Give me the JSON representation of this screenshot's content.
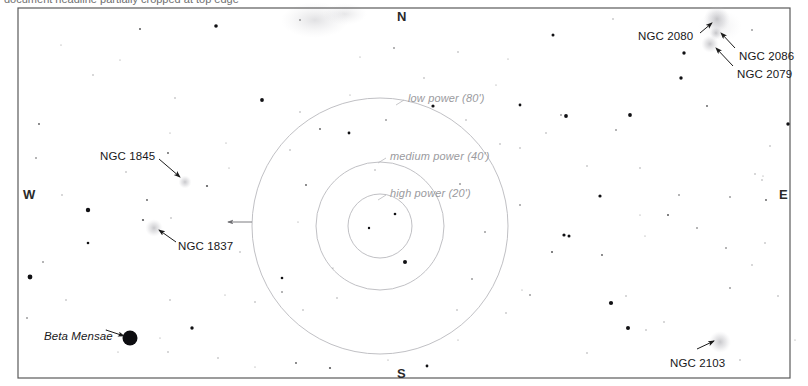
{
  "page": {
    "title_partial": "document headline partially cropped at top edge",
    "background": "#ffffff",
    "frame_color": "#5a5a5a",
    "width": 808,
    "height": 386
  },
  "frame": {
    "x": 18,
    "y": 8,
    "width": 772,
    "height": 370
  },
  "cardinals": [
    {
      "name": "north",
      "label": "N",
      "x": 397,
      "y": 9
    },
    {
      "name": "south",
      "label": "S",
      "x": 397,
      "y": 366
    },
    {
      "name": "east",
      "label": "E",
      "x": 779,
      "y": 187
    },
    {
      "name": "west",
      "label": "W",
      "x": 23,
      "y": 187
    }
  ],
  "eyepiece_circles": {
    "center_x": 380,
    "center_y": 226,
    "stroke": "#b9b9bd",
    "rings": [
      {
        "name": "low-power-ring",
        "label": "low power (80')",
        "radius": 128,
        "label_x": 408,
        "label_y": 92,
        "tick_x": 404,
        "tick_y": 100
      },
      {
        "name": "medium-power-ring",
        "label": "medium power (40')",
        "radius": 64,
        "label_x": 390,
        "label_y": 150,
        "tick_x": 386,
        "tick_y": 158
      },
      {
        "name": "high-power-ring",
        "label": "high power (20')",
        "radius": 32,
        "label_x": 390,
        "label_y": 187,
        "tick_x": 386,
        "tick_y": 195
      }
    ],
    "pointer_arrow": {
      "from_x": 252,
      "from_y": 222,
      "to_x": 228,
      "to_y": 222
    }
  },
  "deep_sky_objects": [
    {
      "name": "ngc-2080",
      "label": "NGC 2080",
      "label_x": 638,
      "label_y": 30,
      "glow_x": 717,
      "glow_y": 19,
      "glow_r": 6,
      "leader": {
        "x1": 700,
        "y1": 33,
        "x2": 712,
        "y2": 23
      }
    },
    {
      "name": "ngc-2086",
      "label": "NGC 2086",
      "label_x": 739,
      "label_y": 50,
      "glow_x": 716,
      "glow_y": 33,
      "glow_r": 3,
      "leader": {
        "x1": 735,
        "y1": 48,
        "x2": 721,
        "y2": 33
      }
    },
    {
      "name": "ngc-2079",
      "label": "NGC 2079",
      "label_x": 737,
      "label_y": 68,
      "glow_x": 710,
      "glow_y": 44,
      "glow_r": 4,
      "leader": {
        "x1": 733,
        "y1": 66,
        "x2": 716,
        "y2": 48
      }
    },
    {
      "name": "ngc-1845",
      "label": "NGC 1845",
      "label_x": 100,
      "label_y": 150,
      "glow_x": 185,
      "glow_y": 182,
      "glow_r": 3,
      "leader": {
        "x1": 159,
        "y1": 159,
        "x2": 180,
        "y2": 177
      }
    },
    {
      "name": "ngc-1837",
      "label": "NGC 1837",
      "label_x": 178,
      "label_y": 240,
      "glow_x": 154,
      "glow_y": 228,
      "glow_r": 4,
      "leader": {
        "x1": 176,
        "y1": 242,
        "x2": 159,
        "y2": 230
      }
    },
    {
      "name": "ngc-2103",
      "label": "NGC 2103",
      "label_x": 670,
      "label_y": 357,
      "glow_x": 720,
      "glow_y": 342,
      "glow_r": 5,
      "leader": {
        "x1": 697,
        "y1": 349,
        "x2": 714,
        "y2": 341
      }
    }
  ],
  "named_stars": [
    {
      "name": "beta-mensae",
      "label": "Beta Mensae",
      "label_x": 44,
      "label_y": 330,
      "star_x": 130,
      "star_y": 338,
      "star_r": 7.5,
      "leader": {
        "x1": 106,
        "y1": 330,
        "x2": 124,
        "y2": 336
      }
    }
  ],
  "nebulosity": [
    {
      "name": "lmc-haze-top",
      "cx": 315,
      "cy": 20,
      "rx": 34,
      "ry": 18,
      "opacity": 0.09
    },
    {
      "name": "lmc-haze-top-right",
      "cx": 345,
      "cy": 14,
      "rx": 22,
      "ry": 11,
      "opacity": 0.07
    },
    {
      "name": "lmc-haze-ne",
      "cx": 720,
      "cy": 26,
      "rx": 22,
      "ry": 16,
      "opacity": 0.05
    }
  ],
  "stars": [
    {
      "x": 140,
      "y": 29,
      "r": 1.0
    },
    {
      "x": 216,
      "y": 26,
      "r": 1.8
    },
    {
      "x": 300,
      "y": 20,
      "r": 0.8
    },
    {
      "x": 360,
      "y": 57,
      "r": 0.6
    },
    {
      "x": 394,
      "y": 48,
      "r": 0.8
    },
    {
      "x": 458,
      "y": 52,
      "r": 0.7
    },
    {
      "x": 508,
      "y": 59,
      "r": 0.6
    },
    {
      "x": 553,
      "y": 35,
      "r": 1.5
    },
    {
      "x": 613,
      "y": 19,
      "r": 0.7
    },
    {
      "x": 684,
      "y": 53,
      "r": 1.7
    },
    {
      "x": 752,
      "y": 30,
      "r": 0.8
    },
    {
      "x": 772,
      "y": 60,
      "r": 0.9
    },
    {
      "x": 681,
      "y": 78,
      "r": 1.7
    },
    {
      "x": 39,
      "y": 124,
      "r": 0.9
    },
    {
      "x": 93,
      "y": 75,
      "r": 0.7
    },
    {
      "x": 175,
      "y": 98,
      "r": 0.7
    },
    {
      "x": 262,
      "y": 100,
      "r": 1.9
    },
    {
      "x": 300,
      "y": 112,
      "r": 0.7
    },
    {
      "x": 320,
      "y": 129,
      "r": 0.9
    },
    {
      "x": 349,
      "y": 133,
      "r": 1.4
    },
    {
      "x": 386,
      "y": 120,
      "r": 0.8
    },
    {
      "x": 433,
      "y": 106,
      "r": 1.6
    },
    {
      "x": 466,
      "y": 120,
      "r": 0.7
    },
    {
      "x": 520,
      "y": 105,
      "r": 1.4
    },
    {
      "x": 561,
      "y": 115,
      "r": 0.8
    },
    {
      "x": 546,
      "y": 133,
      "r": 0.7
    },
    {
      "x": 630,
      "y": 115,
      "r": 1.9
    },
    {
      "x": 707,
      "y": 106,
      "r": 0.9
    },
    {
      "x": 788,
      "y": 124,
      "r": 1.7
    },
    {
      "x": 770,
      "y": 146,
      "r": 0.7
    },
    {
      "x": 36,
      "y": 158,
      "r": 0.8
    },
    {
      "x": 62,
      "y": 195,
      "r": 0.7
    },
    {
      "x": 88,
      "y": 210,
      "r": 2.2
    },
    {
      "x": 88,
      "y": 243,
      "r": 1.3
    },
    {
      "x": 126,
      "y": 172,
      "r": 0.7
    },
    {
      "x": 168,
      "y": 153,
      "r": 0.9
    },
    {
      "x": 147,
      "y": 200,
      "r": 0.9
    },
    {
      "x": 171,
      "y": 218,
      "r": 0.7
    },
    {
      "x": 143,
      "y": 220,
      "r": 1.1
    },
    {
      "x": 207,
      "y": 186,
      "r": 1.1
    },
    {
      "x": 229,
      "y": 168,
      "r": 0.6
    },
    {
      "x": 290,
      "y": 150,
      "r": 0.7
    },
    {
      "x": 306,
      "y": 185,
      "r": 0.9
    },
    {
      "x": 298,
      "y": 222,
      "r": 0.6
    },
    {
      "x": 375,
      "y": 170,
      "r": 0.7
    },
    {
      "x": 395,
      "y": 214,
      "r": 1.3
    },
    {
      "x": 369,
      "y": 228,
      "r": 1.2
    },
    {
      "x": 405,
      "y": 262,
      "r": 2.0
    },
    {
      "x": 460,
      "y": 184,
      "r": 0.8
    },
    {
      "x": 500,
      "y": 144,
      "r": 0.7
    },
    {
      "x": 485,
      "y": 232,
      "r": 0.8
    },
    {
      "x": 520,
      "y": 148,
      "r": 0.7
    },
    {
      "x": 566,
      "y": 116,
      "r": 1.9
    },
    {
      "x": 616,
      "y": 130,
      "r": 0.8
    },
    {
      "x": 587,
      "y": 166,
      "r": 0.7
    },
    {
      "x": 640,
      "y": 168,
      "r": 0.7
    },
    {
      "x": 679,
      "y": 195,
      "r": 0.8
    },
    {
      "x": 600,
      "y": 196,
      "r": 1.6
    },
    {
      "x": 730,
      "y": 197,
      "r": 0.8
    },
    {
      "x": 755,
      "y": 174,
      "r": 0.7
    },
    {
      "x": 762,
      "y": 180,
      "r": 0.7
    },
    {
      "x": 763,
      "y": 176,
      "r": 0.5
    },
    {
      "x": 766,
      "y": 200,
      "r": 0.9
    },
    {
      "x": 520,
      "y": 205,
      "r": 0.8
    },
    {
      "x": 640,
      "y": 215,
      "r": 0.6
    },
    {
      "x": 668,
      "y": 215,
      "r": 1.0
    },
    {
      "x": 569,
      "y": 236,
      "r": 1.5
    },
    {
      "x": 602,
      "y": 255,
      "r": 0.9
    },
    {
      "x": 645,
      "y": 236,
      "r": 0.6
    },
    {
      "x": 697,
      "y": 228,
      "r": 0.8
    },
    {
      "x": 240,
      "y": 252,
      "r": 0.7
    },
    {
      "x": 282,
      "y": 278,
      "r": 1.3
    },
    {
      "x": 282,
      "y": 292,
      "r": 0.8
    },
    {
      "x": 255,
      "y": 302,
      "r": 0.7
    },
    {
      "x": 333,
      "y": 268,
      "r": 0.6
    },
    {
      "x": 337,
      "y": 298,
      "r": 0.7
    },
    {
      "x": 303,
      "y": 310,
      "r": 0.7
    },
    {
      "x": 472,
      "y": 279,
      "r": 0.8
    },
    {
      "x": 457,
      "y": 310,
      "r": 0.7
    },
    {
      "x": 506,
      "y": 313,
      "r": 0.7
    },
    {
      "x": 530,
      "y": 295,
      "r": 0.8
    },
    {
      "x": 564,
      "y": 235,
      "r": 1.6
    },
    {
      "x": 552,
      "y": 252,
      "r": 1.0
    },
    {
      "x": 522,
      "y": 290,
      "r": 0.6
    },
    {
      "x": 626,
      "y": 296,
      "r": 0.7
    },
    {
      "x": 628,
      "y": 328,
      "r": 2.0
    },
    {
      "x": 664,
      "y": 322,
      "r": 0.7
    },
    {
      "x": 730,
      "y": 288,
      "r": 0.8
    },
    {
      "x": 726,
      "y": 248,
      "r": 0.8
    },
    {
      "x": 752,
      "y": 265,
      "r": 0.7
    },
    {
      "x": 765,
      "y": 243,
      "r": 0.7
    },
    {
      "x": 778,
      "y": 296,
      "r": 0.7
    },
    {
      "x": 43,
      "y": 262,
      "r": 0.8
    },
    {
      "x": 30,
      "y": 277,
      "r": 2.4
    },
    {
      "x": 27,
      "y": 318,
      "r": 0.8
    },
    {
      "x": 66,
      "y": 300,
      "r": 0.7
    },
    {
      "x": 106,
      "y": 330,
      "r": 0.5
    },
    {
      "x": 192,
      "y": 328,
      "r": 1.7
    },
    {
      "x": 168,
      "y": 352,
      "r": 0.7
    },
    {
      "x": 218,
      "y": 358,
      "r": 0.7
    },
    {
      "x": 170,
      "y": 300,
      "r": 0.7
    },
    {
      "x": 225,
      "y": 295,
      "r": 0.6
    },
    {
      "x": 160,
      "y": 338,
      "r": 0.6
    },
    {
      "x": 296,
      "y": 363,
      "r": 0.9
    },
    {
      "x": 330,
      "y": 368,
      "r": 1.1
    },
    {
      "x": 388,
      "y": 360,
      "r": 0.6
    },
    {
      "x": 427,
      "y": 366,
      "r": 1.4
    },
    {
      "x": 458,
      "y": 340,
      "r": 0.6
    },
    {
      "x": 118,
      "y": 352,
      "r": 0.6
    },
    {
      "x": 255,
      "y": 367,
      "r": 0.5
    },
    {
      "x": 587,
      "y": 353,
      "r": 0.7
    },
    {
      "x": 611,
      "y": 303,
      "r": 2.1
    },
    {
      "x": 646,
      "y": 330,
      "r": 0.7
    },
    {
      "x": 740,
      "y": 360,
      "r": 0.7
    },
    {
      "x": 795,
      "y": 340,
      "r": 0.6
    },
    {
      "x": 61,
      "y": 45,
      "r": 0.6
    },
    {
      "x": 120,
      "y": 60,
      "r": 0.5
    },
    {
      "x": 226,
      "y": 143,
      "r": 0.6
    },
    {
      "x": 170,
      "y": 133,
      "r": 0.6
    },
    {
      "x": 424,
      "y": 78,
      "r": 0.7
    },
    {
      "x": 496,
      "y": 85,
      "r": 0.6
    },
    {
      "x": 350,
      "y": 95,
      "r": 0.6
    }
  ]
}
